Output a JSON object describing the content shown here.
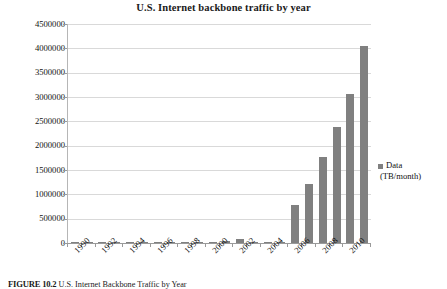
{
  "chart_data": {
    "type": "bar",
    "title": "U.S. Internet backbone traffic by year",
    "xlabel": "",
    "ylabel": "",
    "ylim": [
      0,
      4500000
    ],
    "ytick_step": 500000,
    "yticks": [
      "4500000",
      "4000000",
      "3500000",
      "3000000",
      "2500000",
      "2000000",
      "1500000",
      "1000000",
      "500000",
      "0"
    ],
    "grid": true,
    "legend_position": "right",
    "bar_color": "#808080",
    "gridline_color": "#d9d9d9",
    "categories": [
      "1990",
      "1991",
      "1992",
      "1993",
      "1994",
      "1995",
      "1996",
      "1997",
      "1998",
      "1999",
      "2000",
      "2001",
      "2002",
      "2003",
      "2004",
      "2005",
      "2006",
      "2007",
      "2008",
      "2009",
      "2010",
      "2011"
    ],
    "xtick_labels": [
      "1990",
      "1992",
      "1994",
      "1996",
      "1998",
      "2000",
      "2002",
      "2004",
      "2006",
      "2008",
      "2010"
    ],
    "series": [
      {
        "name": "Data (TB/month)",
        "values": [
          1,
          2,
          4,
          8,
          16,
          150,
          1500,
          2500,
          6000,
          16000,
          20000,
          40000,
          80000,
          2000,
          3000,
          4000,
          780000,
          1210000,
          1760000,
          2380000,
          3060000,
          4050000
        ]
      }
    ],
    "legend": [
      {
        "label_line_1": "Data",
        "label_line_2": "(TB/month)",
        "color": "#808080"
      }
    ]
  },
  "caption": {
    "figure_number": "FIGURE 10.2",
    "text": "U.S. Internet Backbone Traffic by Year"
  }
}
